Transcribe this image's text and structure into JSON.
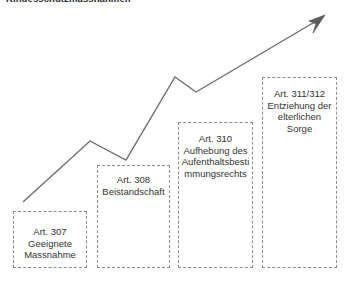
{
  "figure": {
    "title": "Kindesschutzmassnahmen",
    "width": 350,
    "height": 283,
    "background": "#ffffff"
  },
  "arrow": {
    "name": "escalation-arrow",
    "color": "#6e6e6e",
    "stroke_width": 1.4,
    "points": "23,202 90,141 126,160 175,77 196,92 318,20",
    "head_points": "325,15 309,21 316,24 313,33",
    "start": [
      23,
      202
    ],
    "end": [
      325,
      15
    ],
    "vertices": [
      [
        23,
        202
      ],
      [
        90,
        141
      ],
      [
        126,
        160
      ],
      [
        175,
        77
      ],
      [
        196,
        92
      ],
      [
        325,
        15
      ]
    ]
  },
  "boxes": [
    {
      "id": "art-307",
      "label": "Art. 307 Geeignete Massnahme",
      "article": "Art. 307",
      "measure": "Geeignete Massnahme",
      "x": 13,
      "y": 211,
      "width": 74,
      "height": 57,
      "border_color": "#8c8c8c",
      "text_color": "#333333"
    },
    {
      "id": "art-308",
      "label": "Art. 308 Beistandschaft",
      "article": "Art. 308",
      "measure": "Beistandschaft",
      "x": 97,
      "y": 165,
      "width": 73,
      "height": 103,
      "border_color": "#8c8c8c",
      "text_color": "#333333"
    },
    {
      "id": "art-310",
      "label": "Art. 310 Aufhebung des Aufenthaltsbestimmungsrechts",
      "article": "Art. 310",
      "measure": "Aufhebung des Aufenthaltsbestimmungsrechts",
      "x": 178,
      "y": 122,
      "width": 75,
      "height": 146,
      "border_color": "#8c8c8c",
      "text_color": "#333333"
    },
    {
      "id": "art-311-312",
      "label": "Art. 311/312 Entziehung der elterlichen Sorge",
      "article": "Art. 311/312",
      "measure": "Entziehung der elterlichen Sorge",
      "x": 262,
      "y": 77,
      "width": 75,
      "height": 191,
      "border_color": "#8c8c8c",
      "text_color": "#333333"
    }
  ]
}
